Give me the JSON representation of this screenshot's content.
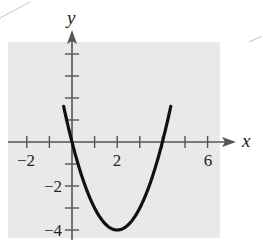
{
  "chart_data": {
    "type": "line",
    "title": "",
    "xlabel": "x",
    "ylabel": "y",
    "xlim": [
      -2.8,
      6.5
    ],
    "ylim": [
      -4.5,
      4.4
    ],
    "grid": false,
    "background": "#e9e9e9",
    "curve_color": "#111111",
    "x_ticks": [
      -2,
      -1,
      1,
      2,
      3,
      4,
      5,
      6
    ],
    "y_ticks": [
      -4,
      -3,
      -2,
      -1,
      1,
      2,
      3,
      4
    ],
    "x_tick_labels": [
      {
        "value": -2,
        "label": "−2"
      },
      {
        "value": 2,
        "label": "2"
      },
      {
        "value": 6,
        "label": "6"
      }
    ],
    "y_tick_labels": [
      {
        "value": -2,
        "label": "−2"
      },
      {
        "value": -4,
        "label": "−4"
      }
    ],
    "series": [
      {
        "name": "parabola",
        "description": "y = x^2 - 4x (vertex at (2, -4), x-intercepts 0 and 4)",
        "x": [
          -0.35,
          -0.25,
          0,
          0.5,
          1,
          1.5,
          2,
          2.5,
          3,
          3.5,
          4,
          4.25,
          4.35
        ],
        "y": [
          1.52,
          1.06,
          0,
          -1.75,
          -3,
          -3.75,
          -4,
          -3.75,
          -3,
          -1.75,
          0,
          1.06,
          1.52
        ]
      }
    ],
    "legend": null
  },
  "labels": {
    "x_axis": "x",
    "y_axis": "y",
    "x_minus2": "−2",
    "x_2": "2",
    "x_6": "6",
    "y_minus2": "−2",
    "y_minus4": "−4"
  }
}
